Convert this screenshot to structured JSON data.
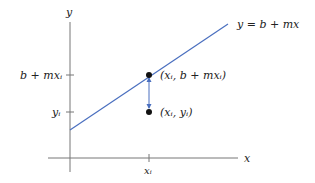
{
  "diagram": {
    "axes": {
      "x_label": "x",
      "y_label": "y"
    },
    "line": {
      "label": "y = b + mx",
      "color": "#4a6fbf"
    },
    "ticks": {
      "x_tick_label": "xᵢ",
      "y_tick_upper_label": "b + mxᵢ",
      "y_tick_lower_label": "yᵢ"
    },
    "points": {
      "fitted_label": "(xᵢ, b + mxᵢ)",
      "observed_label": "(xᵢ, yᵢ)",
      "color": "#111111"
    },
    "residual_arrow_color": "#4a6fbf"
  }
}
